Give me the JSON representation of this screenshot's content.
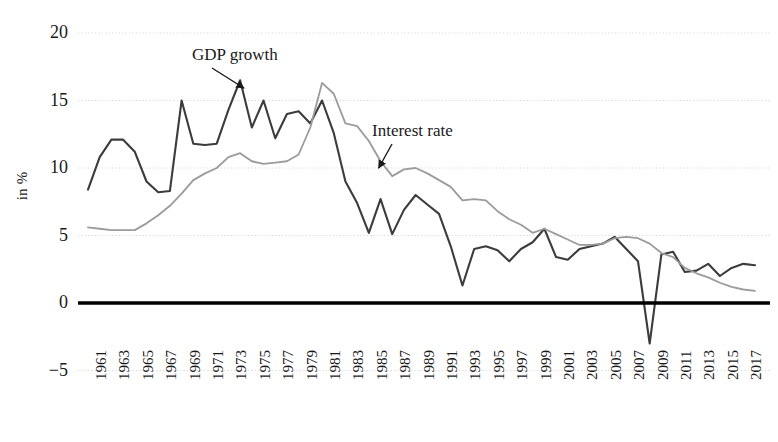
{
  "chart_data": {
    "type": "line",
    "title": "",
    "subtitle": "",
    "xlabel": "",
    "ylabel": "in %",
    "ylim": [
      -5,
      20
    ],
    "xlim": [
      1961,
      2018
    ],
    "grid": true,
    "grid_style": "dotted-horizontal",
    "legend": "annotations-inline",
    "yticks": [
      20,
      15,
      10,
      5,
      0,
      -5
    ],
    "xticks": [
      1961,
      1963,
      1965,
      1967,
      1969,
      1971,
      1973,
      1975,
      1977,
      1979,
      1981,
      1983,
      1985,
      1987,
      1989,
      1991,
      1993,
      1995,
      1997,
      1999,
      2001,
      2003,
      2005,
      2007,
      2009,
      2011,
      2013,
      2015,
      2017
    ],
    "x": [
      1961,
      1962,
      1963,
      1964,
      1965,
      1966,
      1967,
      1968,
      1969,
      1970,
      1971,
      1972,
      1973,
      1974,
      1975,
      1976,
      1977,
      1978,
      1979,
      1980,
      1981,
      1982,
      1983,
      1984,
      1985,
      1986,
      1987,
      1988,
      1989,
      1990,
      1991,
      1992,
      1993,
      1994,
      1995,
      1996,
      1997,
      1998,
      1999,
      2000,
      2001,
      2002,
      2003,
      2004,
      2005,
      2006,
      2007,
      2008,
      2009,
      2010,
      2011,
      2012,
      2013,
      2014,
      2015,
      2016,
      2017,
      2018
    ],
    "series": [
      {
        "name": "GDP growth",
        "color": "#3c3c3c",
        "width": 2.1,
        "values": [
          8.4,
          10.8,
          12.1,
          12.1,
          11.2,
          9.0,
          8.2,
          8.3,
          15.0,
          11.8,
          11.7,
          11.8,
          14.3,
          16.5,
          13.0,
          15.0,
          12.2,
          14.0,
          14.2,
          13.3,
          15.0,
          12.6,
          9.0,
          7.4,
          5.2,
          7.7,
          5.1,
          6.9,
          8.0,
          7.3,
          6.6,
          4.2,
          1.3,
          4.0,
          4.2,
          3.9,
          3.1,
          4.0,
          4.5,
          5.5,
          3.4,
          3.2,
          4.0,
          4.2,
          4.4,
          4.9,
          4.0,
          3.1,
          -3.0,
          3.6,
          3.8,
          2.3,
          2.4,
          2.9,
          2.0,
          2.6,
          2.9,
          2.8
        ]
      },
      {
        "name": "Interest rate",
        "color": "#9b9b9b",
        "width": 1.8,
        "values": [
          5.6,
          5.5,
          5.4,
          5.4,
          5.4,
          5.9,
          6.5,
          7.2,
          8.1,
          9.1,
          9.6,
          10.0,
          10.8,
          11.1,
          10.5,
          10.3,
          10.4,
          10.5,
          11.0,
          13.0,
          16.3,
          15.5,
          13.3,
          13.1,
          12.0,
          10.5,
          9.4,
          9.9,
          10.0,
          9.6,
          9.1,
          8.6,
          7.6,
          7.7,
          7.6,
          6.8,
          6.2,
          5.8,
          5.2,
          5.5,
          5.1,
          4.7,
          4.3,
          4.3,
          4.4,
          4.8,
          4.9,
          4.8,
          4.4,
          3.7,
          3.4,
          2.6,
          2.2,
          1.9,
          1.5,
          1.2,
          1.0,
          0.9
        ]
      }
    ],
    "annotations": [
      {
        "label": "GDP growth",
        "target_series": "GDP growth",
        "target_x": 1974,
        "target_y": 16.5
      },
      {
        "label": "Interest rate",
        "target_series": "Interest rate",
        "target_x": 1986,
        "target_y": 10.5
      }
    ],
    "zero_line": {
      "value": 0,
      "color": "#000000",
      "width": 3.5
    }
  },
  "axis": {
    "y_label": "in %",
    "y_ticks": [
      "20",
      "15",
      "10",
      "5",
      "0",
      "−5"
    ],
    "x_ticks": [
      "1961",
      "1963",
      "1965",
      "1967",
      "1969",
      "1971",
      "1973",
      "1975",
      "1977",
      "1979",
      "1981",
      "1983",
      "1985",
      "1987",
      "1989",
      "1991",
      "1993",
      "1995",
      "1997",
      "1999",
      "2001",
      "2003",
      "2005",
      "2007",
      "2009",
      "2011",
      "2013",
      "2015",
      "2017"
    ]
  },
  "annotations": {
    "gdp_growth": "GDP growth",
    "interest_rate": "Interest rate"
  },
  "colors": {
    "gdp_line": "#3c3c3c",
    "interest_line": "#9b9b9b",
    "zero_line": "#000000",
    "grid": "#d8d8d8",
    "background": "#ffffff",
    "text": "#1a1a1a"
  }
}
